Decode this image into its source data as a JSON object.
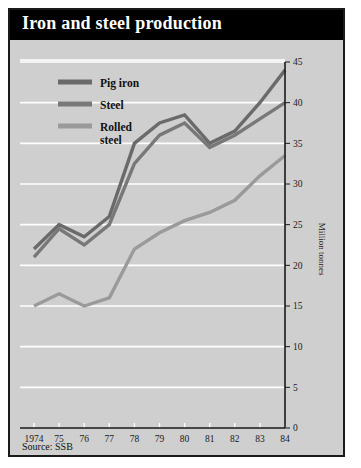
{
  "panel": {
    "title": "Iron and steel production",
    "source": "Source: SSB",
    "title_bg": "#000000",
    "title_fg": "#ffffff",
    "panel_bg": "#cfcfcf",
    "border": "#1a1a1a"
  },
  "chart_data": {
    "type": "line",
    "title": "Iron and steel production",
    "xlabel": "",
    "ylabel": "Million tonnes",
    "x": [
      "1974",
      "75",
      "76",
      "77",
      "78",
      "79",
      "80",
      "81",
      "82",
      "83",
      "84"
    ],
    "xlim": [
      1974,
      1984
    ],
    "ylim": [
      0,
      45
    ],
    "yticks": [
      0,
      5,
      10,
      15,
      20,
      25,
      30,
      35,
      40,
      45
    ],
    "grid": "horizontal-white",
    "legend_position": "top-left",
    "series": [
      {
        "name": "Pig iron",
        "color": "#6a6a6a",
        "values": [
          22,
          25,
          23.5,
          26,
          35,
          37.5,
          38.5,
          35,
          36.5,
          40,
          44
        ]
      },
      {
        "name": "Steel",
        "color": "#787878",
        "values": [
          21,
          24.5,
          22.5,
          25,
          32.5,
          36,
          37.5,
          34.5,
          36,
          38,
          40
        ]
      },
      {
        "name": "Rolled steel",
        "color": "#9a9a9a",
        "values": [
          15,
          16.5,
          15,
          16,
          22,
          24,
          25.5,
          26.5,
          28,
          31,
          33.5
        ]
      }
    ],
    "source": "Source: SSB"
  },
  "legend": {
    "items": [
      {
        "label": "Pig iron"
      },
      {
        "label": "Steel"
      },
      {
        "label_line1": "Rolled",
        "label_line2": "steel"
      }
    ]
  }
}
